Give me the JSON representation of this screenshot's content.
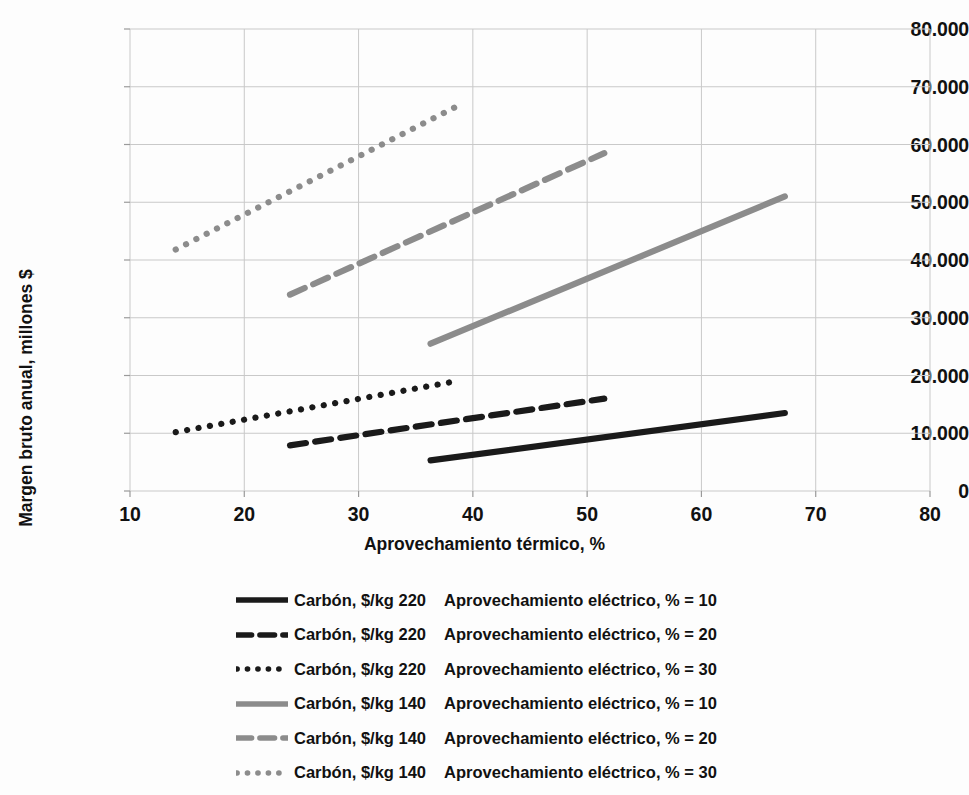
{
  "chart_data": {
    "type": "line",
    "title": "",
    "xlabel": "Aprovechamiento térmico, %",
    "ylabel": "Margen bruto anual, millones $",
    "xlim": [
      10,
      80
    ],
    "ylim": [
      0,
      80000
    ],
    "xticks": [
      "10",
      "20",
      "30",
      "40",
      "50",
      "60",
      "70",
      "80"
    ],
    "xtick_values": [
      10,
      20,
      30,
      40,
      50,
      60,
      70,
      80
    ],
    "yticks": [
      "0",
      "10.000",
      "20.000",
      "30.000",
      "40.000",
      "50.000",
      "60.000",
      "70.000",
      "80.000"
    ],
    "ytick_values": [
      0,
      10000,
      20000,
      30000,
      40000,
      50000,
      60000,
      70000,
      80000
    ],
    "grid": true,
    "legend_position": "bottom",
    "colors": {
      "black": "#1a1a1a",
      "gray": "#8c8c8c",
      "grid": "#c9c9c9",
      "axis": "#9a9a9a"
    },
    "series": [
      {
        "name": "Carbón, $/kg 220   Aprovechamiento eléctrico, % = 10",
        "coal_price_label": "Carbón, $/kg 220",
        "electric_label": "Aprovechamiento eléctrico, % = 10",
        "coal_price": 220,
        "electric_efficiency": 10,
        "color": "#1a1a1a",
        "dash": "solid",
        "x": [
          36.3,
          67.3
        ],
        "values": [
          5300,
          13500
        ]
      },
      {
        "name": "Carbón, $/kg 220   Aprovechamiento eléctrico, % = 20",
        "coal_price_label": "Carbón, $/kg 220",
        "electric_label": "Aprovechamiento eléctrico, % = 20",
        "coal_price": 220,
        "electric_efficiency": 20,
        "color": "#1a1a1a",
        "dash": "dashed",
        "x": [
          24.0,
          51.5
        ],
        "values": [
          7900,
          16000
        ]
      },
      {
        "name": "Carbón, $/kg 220   Aprovechamiento eléctrico, % = 30",
        "coal_price_label": "Carbón, $/kg 220",
        "electric_label": "Aprovechamiento eléctrico, % = 30",
        "coal_price": 220,
        "electric_efficiency": 30,
        "color": "#1a1a1a",
        "dash": "dotted",
        "x": [
          14.0,
          38.5
        ],
        "values": [
          10200,
          19000
        ]
      },
      {
        "name": "Carbón, $/kg 140   Aprovechamiento eléctrico, % = 10",
        "coal_price_label": "Carbón, $/kg 140",
        "electric_label": "Aprovechamiento eléctrico, % = 10",
        "coal_price": 140,
        "electric_efficiency": 10,
        "color": "#8c8c8c",
        "dash": "solid",
        "x": [
          36.3,
          67.3
        ],
        "values": [
          25500,
          51000
        ]
      },
      {
        "name": "Carbón, $/kg 140   Aprovechamiento eléctrico, % = 20",
        "coal_price_label": "Carbón, $/kg 140",
        "electric_label": "Aprovechamiento eléctrico, % = 20",
        "coal_price": 140,
        "electric_efficiency": 20,
        "color": "#8c8c8c",
        "dash": "dashed",
        "x": [
          24.0,
          51.5
        ],
        "values": [
          34000,
          58500
        ]
      },
      {
        "name": "Carbón, $/kg 140   Aprovechamiento eléctrico, % = 30",
        "coal_price_label": "Carbón, $/kg 140",
        "electric_label": "Aprovechamiento eléctrico, % = 30",
        "coal_price": 140,
        "electric_efficiency": 30,
        "color": "#8c8c8c",
        "dash": "dotted",
        "x": [
          14.0,
          38.5
        ],
        "values": [
          41800,
          66500
        ]
      }
    ]
  },
  "axes": {
    "ylabel": "Margen bruto anual, millones $",
    "xlabel": "Aprovechamiento térmico, %"
  },
  "legend": {
    "items": [
      {
        "coal": "Carbón, $/kg 220",
        "electric": "Aprovechamiento eléctrico, % = 10"
      },
      {
        "coal": "Carbón, $/kg 220",
        "electric": "Aprovechamiento eléctrico, % = 20"
      },
      {
        "coal": "Carbón, $/kg 220",
        "electric": "Aprovechamiento eléctrico, % = 30"
      },
      {
        "coal": "Carbón, $/kg 140",
        "electric": "Aprovechamiento eléctrico, % = 10"
      },
      {
        "coal": "Carbón, $/kg 140",
        "electric": "Aprovechamiento eléctrico, % = 20"
      },
      {
        "coal": "Carbón, $/kg 140",
        "electric": "Aprovechamiento eléctrico, % = 30"
      }
    ]
  }
}
